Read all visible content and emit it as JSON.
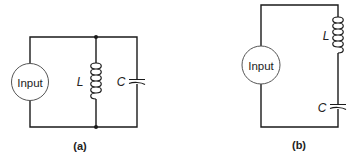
{
  "figure": {
    "circuit_a": {
      "label": "(a)",
      "source_label": "Input",
      "inductor_label": "L",
      "capacitor_label": "C",
      "configuration": "parallel"
    },
    "circuit_b": {
      "label": "(b)",
      "source_label": "Input",
      "inductor_label": "L",
      "capacitor_label": "C",
      "configuration": "series"
    }
  }
}
